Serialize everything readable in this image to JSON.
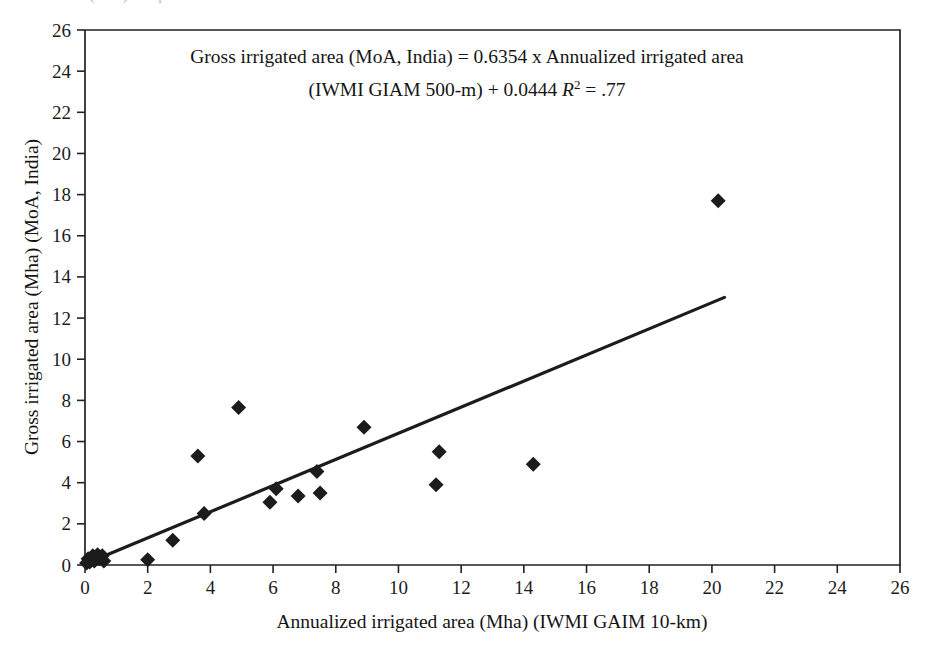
{
  "figure": {
    "top_cut_text": "ated area (Mha) comparison",
    "equation_line1": "Gross irrigated area (MoA, India) = 0.6354 x Annualized irrigated area",
    "equation_line2_pre": "(IWMI GIAM 500-m) + 0.0444 ",
    "equation_r": "R",
    "equation_r_sup": "2",
    "equation_line2_post": " = .77",
    "marker_color": "#1c1c1c",
    "line_color": "#1c1c1c",
    "axis_color": "#222222"
  },
  "chart_data": {
    "type": "scatter",
    "title": "Gross irrigated area (MoA, India) = 0.6354 x Annualized irrigated area (IWMI GIAM 500-m) + 0.0444 R2 = .77",
    "xlabel": "Annualized irrigated area (Mha) (IWMI GAIM 10-km)",
    "ylabel": "Gross irrigated area (Mha) (MoA, India)",
    "xlim": [
      0,
      26
    ],
    "ylim": [
      0,
      26
    ],
    "xticks": [
      0,
      2,
      4,
      6,
      8,
      10,
      12,
      14,
      16,
      18,
      20,
      22,
      24,
      26
    ],
    "yticks": [
      0,
      2,
      4,
      6,
      8,
      10,
      12,
      14,
      16,
      18,
      20,
      22,
      24,
      26
    ],
    "grid": false,
    "legend": false,
    "marker": "diamond",
    "points": [
      {
        "x": 0.05,
        "y": 0.1
      },
      {
        "x": 0.1,
        "y": 0.3
      },
      {
        "x": 0.15,
        "y": 0.15
      },
      {
        "x": 0.25,
        "y": 0.45
      },
      {
        "x": 0.3,
        "y": 0.2
      },
      {
        "x": 0.4,
        "y": 0.5
      },
      {
        "x": 0.45,
        "y": 0.3
      },
      {
        "x": 0.55,
        "y": 0.45
      },
      {
        "x": 0.6,
        "y": 0.2
      },
      {
        "x": 2.0,
        "y": 0.25
      },
      {
        "x": 2.8,
        "y": 1.2
      },
      {
        "x": 3.6,
        "y": 5.3
      },
      {
        "x": 3.8,
        "y": 2.5
      },
      {
        "x": 4.9,
        "y": 7.65
      },
      {
        "x": 5.9,
        "y": 3.05
      },
      {
        "x": 6.1,
        "y": 3.7
      },
      {
        "x": 6.8,
        "y": 3.35
      },
      {
        "x": 7.4,
        "y": 4.55
      },
      {
        "x": 7.5,
        "y": 3.5
      },
      {
        "x": 8.9,
        "y": 6.7
      },
      {
        "x": 11.2,
        "y": 3.9
      },
      {
        "x": 11.3,
        "y": 5.5
      },
      {
        "x": 14.3,
        "y": 4.9
      },
      {
        "x": 20.2,
        "y": 17.7
      }
    ],
    "trendline": {
      "slope": 0.6354,
      "intercept": 0.0444,
      "r_squared": 0.77,
      "x_start": 0,
      "x_end": 20.4
    }
  }
}
